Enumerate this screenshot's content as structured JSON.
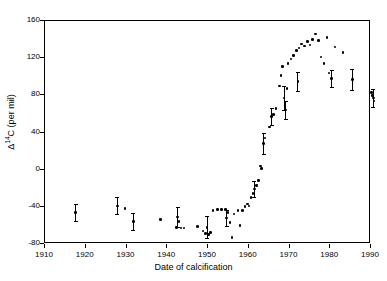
{
  "chart_data": {
    "type": "scatter",
    "title": "",
    "xlabel": "Date of calcification",
    "ylabel_prefix": "Δ",
    "ylabel_sup": "14",
    "ylabel_suffix": "C (per mil)",
    "ylabel_plain": "Δ14C (per mil)",
    "xlim": [
      1910,
      1990
    ],
    "ylim": [
      -80,
      160
    ],
    "xticks": [
      1910,
      1920,
      1930,
      1940,
      1950,
      1960,
      1970,
      1980,
      1990
    ],
    "yticks": [
      -80,
      -40,
      0,
      40,
      80,
      120,
      160
    ],
    "grid": false,
    "legend": "none",
    "marker_color": "#000000",
    "points": [
      {
        "x": 1917.8,
        "y": -47,
        "err": 9
      },
      {
        "x": 1928.0,
        "y": -40,
        "err": 9
      },
      {
        "x": 1929.9,
        "y": -43,
        "err": 0
      },
      {
        "x": 1931.9,
        "y": -57,
        "err": 9
      },
      {
        "x": 1938.6,
        "y": -55,
        "err": 0
      },
      {
        "x": 1942.5,
        "y": -63,
        "err": 0
      },
      {
        "x": 1942.8,
        "y": -52,
        "err": 11
      },
      {
        "x": 1943.1,
        "y": -57,
        "err": 0
      },
      {
        "x": 1943.6,
        "y": -64,
        "err": 0
      },
      {
        "x": 1944.4,
        "y": -64,
        "err": 0
      },
      {
        "x": 1947.6,
        "y": -62,
        "err": 0
      },
      {
        "x": 1949.0,
        "y": -67,
        "err": 0
      },
      {
        "x": 1949.7,
        "y": -70,
        "err": 0
      },
      {
        "x": 1950.0,
        "y": -63,
        "err": 12
      },
      {
        "x": 1950.3,
        "y": -71,
        "err": 0
      },
      {
        "x": 1950.9,
        "y": -69,
        "err": 0
      },
      {
        "x": 1951.5,
        "y": -45,
        "err": 0
      },
      {
        "x": 1952.6,
        "y": -44,
        "err": 0
      },
      {
        "x": 1953.6,
        "y": -44,
        "err": 0
      },
      {
        "x": 1954.6,
        "y": -44,
        "err": 0
      },
      {
        "x": 1954.8,
        "y": -53,
        "err": 9
      },
      {
        "x": 1955.2,
        "y": -47,
        "err": 0
      },
      {
        "x": 1955.6,
        "y": -58,
        "err": 0
      },
      {
        "x": 1956.1,
        "y": -74,
        "err": 0
      },
      {
        "x": 1956.6,
        "y": -49,
        "err": 0
      },
      {
        "x": 1957.6,
        "y": -45,
        "err": 0
      },
      {
        "x": 1958.1,
        "y": -61,
        "err": 0
      },
      {
        "x": 1958.7,
        "y": -45,
        "err": 0
      },
      {
        "x": 1959.3,
        "y": -41,
        "err": 0
      },
      {
        "x": 1959.9,
        "y": -38,
        "err": 0
      },
      {
        "x": 1960.3,
        "y": -40,
        "err": 0
      },
      {
        "x": 1960.8,
        "y": -31,
        "err": 0
      },
      {
        "x": 1961.3,
        "y": -27,
        "err": 0
      },
      {
        "x": 1961.6,
        "y": -22,
        "err": 9
      },
      {
        "x": 1962.2,
        "y": -18,
        "err": 0
      },
      {
        "x": 1962.6,
        "y": -13,
        "err": 0
      },
      {
        "x": 1963.2,
        "y": 3,
        "err": 0
      },
      {
        "x": 1963.4,
        "y": 0,
        "err": 0
      },
      {
        "x": 1963.9,
        "y": 27,
        "err": 11
      },
      {
        "x": 1964.2,
        "y": 33,
        "err": 0
      },
      {
        "x": 1965.3,
        "y": 45,
        "err": 0
      },
      {
        "x": 1965.9,
        "y": 56,
        "err": 9
      },
      {
        "x": 1966.3,
        "y": 58,
        "err": 0
      },
      {
        "x": 1966.9,
        "y": 65,
        "err": 0
      },
      {
        "x": 1967.8,
        "y": 89,
        "err": 0
      },
      {
        "x": 1968.2,
        "y": 100,
        "err": 0
      },
      {
        "x": 1968.6,
        "y": 110,
        "err": 0
      },
      {
        "x": 1968.9,
        "y": 76,
        "err": 13
      },
      {
        "x": 1969.3,
        "y": 63,
        "err": 10
      },
      {
        "x": 1969.6,
        "y": 86,
        "err": 0
      },
      {
        "x": 1969.9,
        "y": 113,
        "err": 0
      },
      {
        "x": 1970.6,
        "y": 118,
        "err": 0
      },
      {
        "x": 1971.2,
        "y": 122,
        "err": 0
      },
      {
        "x": 1971.9,
        "y": 127,
        "err": 0
      },
      {
        "x": 1972.3,
        "y": 94,
        "err": 10
      },
      {
        "x": 1972.6,
        "y": 130,
        "err": 0
      },
      {
        "x": 1973.2,
        "y": 134,
        "err": 0
      },
      {
        "x": 1973.9,
        "y": 132,
        "err": 0
      },
      {
        "x": 1974.6,
        "y": 137,
        "err": 0
      },
      {
        "x": 1975.3,
        "y": 133,
        "err": 0
      },
      {
        "x": 1975.9,
        "y": 139,
        "err": 0
      },
      {
        "x": 1976.6,
        "y": 145,
        "err": 0
      },
      {
        "x": 1977.4,
        "y": 138,
        "err": 0
      },
      {
        "x": 1978.0,
        "y": 120,
        "err": 0
      },
      {
        "x": 1978.7,
        "y": 113,
        "err": 0
      },
      {
        "x": 1979.4,
        "y": 141,
        "err": 0
      },
      {
        "x": 1979.9,
        "y": 103,
        "err": 0
      },
      {
        "x": 1980.6,
        "y": 97,
        "err": 9
      },
      {
        "x": 1981.4,
        "y": 131,
        "err": 0
      },
      {
        "x": 1983.4,
        "y": 125,
        "err": 0
      },
      {
        "x": 1985.7,
        "y": 96,
        "err": 11
      },
      {
        "x": 1990.4,
        "y": 82,
        "err": 0
      },
      {
        "x": 1990.6,
        "y": 79,
        "err": 0
      },
      {
        "x": 1990.8,
        "y": 76,
        "err": 10
      },
      {
        "x": 1991.0,
        "y": 73,
        "err": 0
      }
    ]
  }
}
